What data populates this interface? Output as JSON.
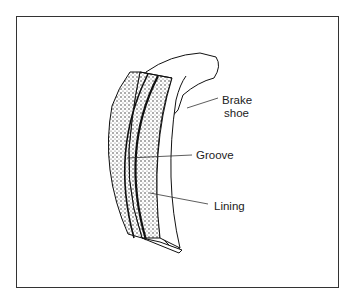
{
  "diagram": {
    "labels": [
      {
        "id": "brake-shoe",
        "lines": [
          "Brake",
          "shoe"
        ]
      },
      {
        "id": "groove",
        "lines": [
          "Groove"
        ]
      },
      {
        "id": "lining",
        "lines": [
          "Lining"
        ]
      }
    ]
  }
}
